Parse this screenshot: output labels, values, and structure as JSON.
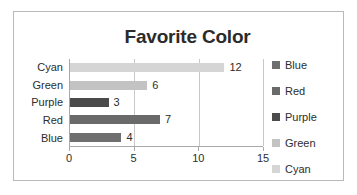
{
  "chart_data": {
    "type": "bar",
    "orientation": "horizontal",
    "title": "Favorite Color",
    "xlabel": "",
    "ylabel": "",
    "categories": [
      "Cyan",
      "Green",
      "Purple",
      "Red",
      "Blue"
    ],
    "values": [
      12,
      6,
      3,
      7,
      4
    ],
    "data_labels": [
      "12",
      "6",
      "3",
      "7",
      "4"
    ],
    "xlim": [
      0,
      15
    ],
    "xticks": [
      0,
      5,
      10,
      15
    ],
    "xtick_labels": [
      "0",
      "5",
      "10",
      "15"
    ],
    "grid": "vertical",
    "legend_position": "right",
    "legend": [
      {
        "label": "Blue",
        "color": "#6f6f6f"
      },
      {
        "label": "Red",
        "color": "#6a6a6a"
      },
      {
        "label": "Purple",
        "color": "#4b4b4b"
      },
      {
        "label": "Green",
        "color": "#c3c3c3"
      },
      {
        "label": "Cyan",
        "color": "#d5d5d5"
      }
    ],
    "bar_colors": [
      "#d5d5d5",
      "#c3c3c3",
      "#4b4b4b",
      "#6a6a6a",
      "#6f6f6f"
    ],
    "frame_color": "#b9b9b9",
    "axis_color": "#a9a9a9",
    "gridline_color": "#c9c9c9",
    "background": "#ffffff"
  }
}
